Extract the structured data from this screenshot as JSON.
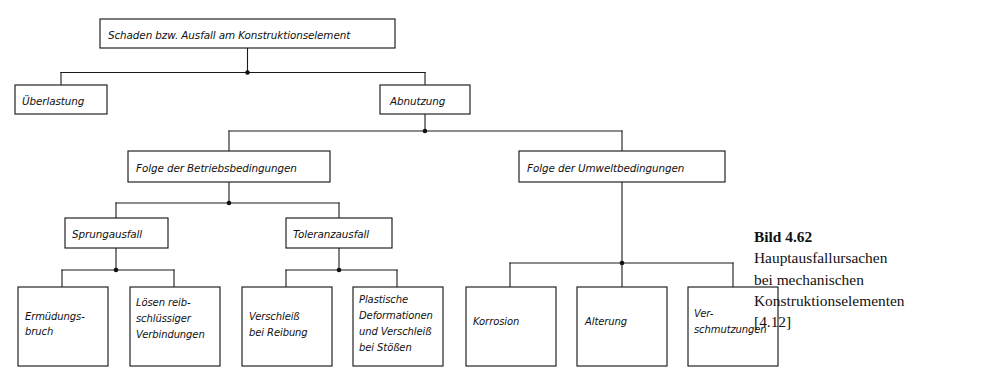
{
  "figure": {
    "caption_title": "Bild 4.62",
    "caption_lines": [
      "Hauptausfallursachen",
      "bei mechanischen",
      "Konstruktionselementen",
      "[4.12]"
    ],
    "ink_color": "#111111",
    "background_color": "#ffffff"
  },
  "nodes": {
    "root": "Schaden bzw. Ausfall am Konstruktionselement",
    "overload": "Überlastung",
    "wear": "Abnutzung",
    "operating_conditions": "Folge der Betriebsbedingungen",
    "environmental_conditions": "Folge der Umweltbedingungen",
    "sudden_failure": "Sprungausfall",
    "tolerance_failure": "Toleranzausfall",
    "fatigue_fracture": [
      "Ermüdungs-",
      "bruch"
    ],
    "loosening_friction": [
      "Lösen reib-",
      "schlüssiger",
      "Verbindungen"
    ],
    "wear_friction": [
      "Verschleiß",
      "bei Reibung"
    ],
    "plastic_deformation": [
      "Plastische",
      "Deformationen",
      "und Verschleiß",
      "bei Stößen"
    ],
    "corrosion": "Korrosion",
    "ageing": "Alterung",
    "soiling": [
      "Ver-",
      "schmutzungen"
    ]
  }
}
